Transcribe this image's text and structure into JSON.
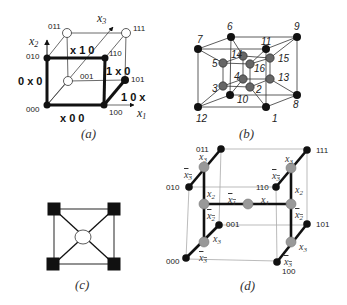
{
  "panels": {
    "a": {
      "caption": "(a)",
      "axes": {
        "x1": "x",
        "x1_sub": "1",
        "x2": "x",
        "x2_sub": "2",
        "x3": "x",
        "x3_sub": "3"
      },
      "nodes": [
        {
          "id": "000",
          "label": "000",
          "fill": "black"
        },
        {
          "id": "100",
          "label": "100",
          "fill": "black"
        },
        {
          "id": "010",
          "label": "010",
          "fill": "black"
        },
        {
          "id": "110",
          "label": "110",
          "fill": "black"
        },
        {
          "id": "001",
          "label": "001",
          "fill": "white"
        },
        {
          "id": "101",
          "label": "101",
          "fill": "black"
        },
        {
          "id": "011",
          "label": "011",
          "fill": "white"
        },
        {
          "id": "111",
          "label": "111",
          "fill": "white"
        }
      ],
      "edge_labels": {
        "bottom": "x 0 0",
        "left": "0 x 0",
        "top": "x 1 0",
        "right": "1 x 0",
        "diag": "1 0 x"
      }
    },
    "b": {
      "caption": "(b)",
      "outer_nodes": [
        "6",
        "9",
        "7",
        "11",
        "10",
        "8",
        "12",
        "1"
      ],
      "inner_nodes": [
        "14",
        "15",
        "5",
        "16",
        "4",
        "13",
        "3",
        "2"
      ]
    },
    "c": {
      "caption": "(c)"
    },
    "d": {
      "caption": "(d)",
      "nodes": [
        "011",
        "111",
        "010",
        "110",
        "001",
        "101",
        "000",
        "100"
      ],
      "literals": {
        "x3": "x",
        "x3_sub": "3",
        "x2": "x",
        "x2_sub": "2",
        "x1": "x",
        "x1_sub": "1"
      }
    }
  }
}
